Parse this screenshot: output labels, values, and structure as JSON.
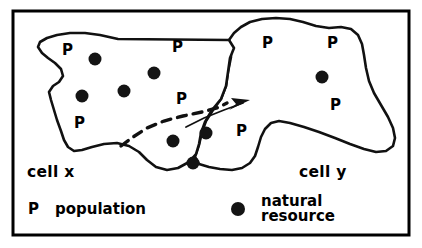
{
  "figure": {
    "type": "conceptual-diagram",
    "background_color": "#ffffff",
    "ink_color": "#000000",
    "frame": {
      "x": 13,
      "y": 11,
      "width": 396,
      "height": 224,
      "stroke_width": 3
    }
  },
  "cells": [
    {
      "id": "cell-x",
      "label": "cell x",
      "label_pos": {
        "x": 27,
        "y": 177
      },
      "outline_path": "M 118 39 L 229 40 L 234 48 L 230 58 L 228 72 L 226 86 L 221 99 L 212 110 L 205 122 L 201 133 L 199 144 L 196 154 L 189 162 L 178 168 L 167 170 L 156 167 L 147 160 L 139 152 L 129 146 L 117 143 L 104 144 L 92 147 L 82 150 L 74 151 L 68 147 L 64 140 L 61 131 L 57 120 L 54 110 L 51 100 L 49 92 L 53 86 L 59 82 L 63 76 L 61 69 L 55 63 L 48 58 L 42 53 L 38 47 L 40 42 L 47 38 L 57 35 L 70 33 L 85 33 L 100 35 Z"
    },
    {
      "id": "cell-y",
      "label": "cell y",
      "label_pos": {
        "x": 299,
        "y": 177
      },
      "outline_path": "M 229 40 L 234 33 L 241 27 L 250 22 L 262 19 L 276 18 L 290 19 L 303 22 L 316 26 L 329 28 L 341 27 L 351 29 L 358 35 L 362 44 L 364 55 L 366 68 L 369 81 L 374 93 L 381 105 L 388 117 L 393 128 L 395 138 L 393 146 L 386 151 L 376 152 L 364 149 L 350 144 L 335 138 L 319 132 L 304 127 L 290 123 L 279 121 L 271 123 L 265 129 L 261 137 L 258 147 L 255 156 L 250 163 L 242 168 L 232 170 L 220 169 L 209 167 L 199 164 L 195 157 L 199 145 L 202 132 L 206 121 L 213 110 L 221 99 L 226 86 L 228 72 L 231 57 Z"
    }
  ],
  "population_labels": [
    {
      "text": "P",
      "x": 62,
      "y": 55,
      "cell": "cell-x"
    },
    {
      "text": "P",
      "x": 172,
      "y": 52,
      "cell": "cell-x"
    },
    {
      "text": "P",
      "x": 176,
      "y": 104,
      "cell": "cell-x"
    },
    {
      "text": "P",
      "x": 74,
      "y": 128,
      "cell": "cell-x"
    },
    {
      "text": "P",
      "x": 236,
      "y": 136,
      "cell": "cell-x-overlap"
    },
    {
      "text": "P",
      "x": 262,
      "y": 48,
      "cell": "cell-y"
    },
    {
      "text": "P",
      "x": 327,
      "y": 48,
      "cell": "cell-y"
    },
    {
      "text": "P",
      "x": 330,
      "y": 110,
      "cell": "cell-y"
    }
  ],
  "resource_dots": [
    {
      "x": 95,
      "y": 59,
      "r": 6.5,
      "cell": "cell-x"
    },
    {
      "x": 154,
      "y": 73,
      "r": 6.5,
      "cell": "cell-x"
    },
    {
      "x": 82,
      "y": 96,
      "r": 6.5,
      "cell": "cell-x"
    },
    {
      "x": 124,
      "y": 91,
      "r": 6.5,
      "cell": "cell-x"
    },
    {
      "x": 173,
      "y": 141,
      "r": 6.5,
      "cell": "cell-x-lobe"
    },
    {
      "x": 206,
      "y": 133,
      "r": 6.5,
      "cell": "cell-x-lobe"
    },
    {
      "x": 193,
      "y": 163,
      "r": 6.5,
      "cell": "cell-x-lobe"
    },
    {
      "x": 322,
      "y": 77,
      "r": 6.5,
      "cell": "cell-y"
    }
  ],
  "flow": {
    "dashed_path": "M 121 146 L 133 137 L 147 128 L 164 121 L 183 116 L 202 112 L 217 108 L 227 103",
    "arrow_tail_path": "M 186 127 L 204 118 L 224 110 L 243 103",
    "arrow_head_points": "250,100 231,98 236,104 229,110",
    "label": "resource flow"
  },
  "legend": {
    "items": [
      {
        "key_type": "letter",
        "key": "P",
        "key_pos": {
          "x": 28,
          "y": 214
        },
        "label": "population",
        "label_pos": {
          "x": 55,
          "y": 214
        }
      },
      {
        "key_type": "dot",
        "key": "filled-circle",
        "key_pos": {
          "x": 238,
          "y": 209
        },
        "label_line1": "natural",
        "label_line2": "resource",
        "label_pos": {
          "x": 261,
          "y": 204
        }
      }
    ]
  }
}
